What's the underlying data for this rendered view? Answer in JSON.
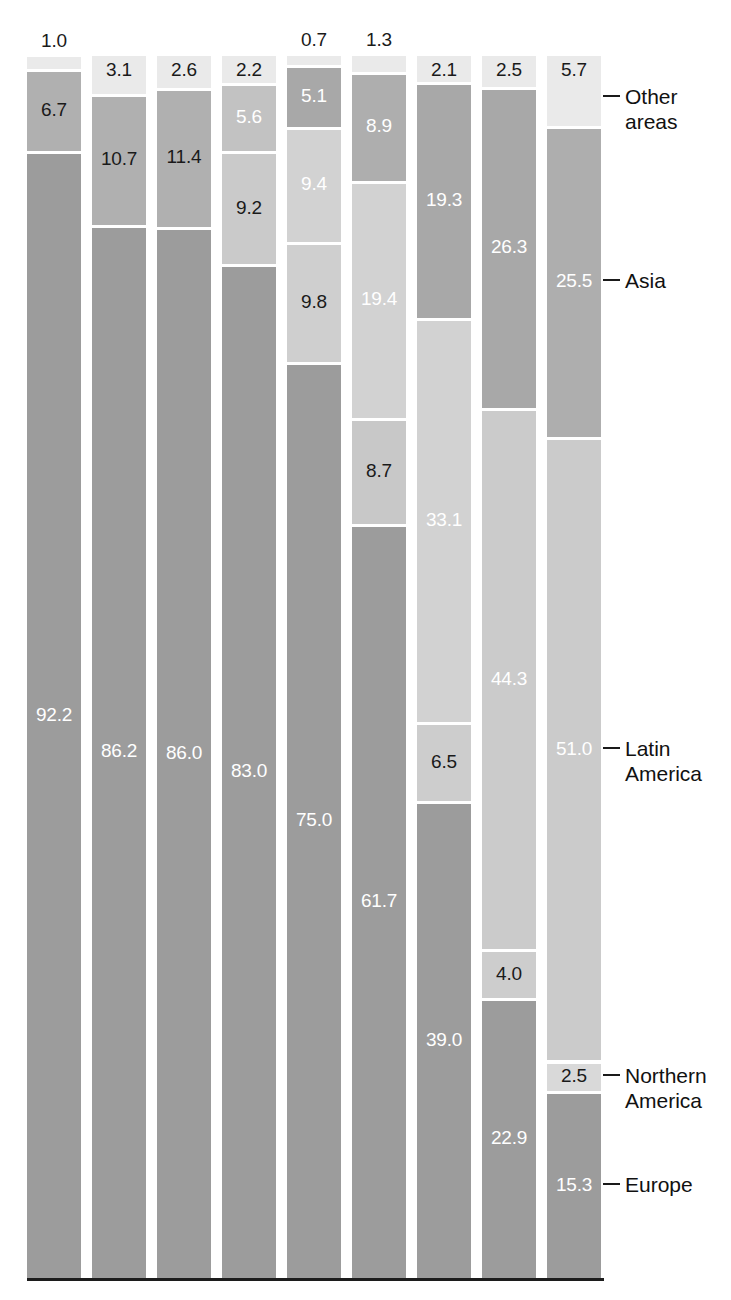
{
  "chart_data": {
    "type": "bar",
    "subtype": "stacked-bar-100-percent",
    "title": "",
    "subtitle": "",
    "xlabel": "",
    "ylabel": "",
    "ylim": [
      0,
      100
    ],
    "grid": false,
    "legend_position": "right-inline-callouts",
    "orientation": "vertical",
    "stack_order_bottom_to_top": [
      "Europe",
      "Northern America",
      "Latin America",
      "Asia",
      "Other areas"
    ],
    "categories": [
      "1",
      "2",
      "3",
      "4",
      "5",
      "6",
      "7",
      "8",
      "9"
    ],
    "series": [
      {
        "name": "Europe",
        "color": "#9c9c9c",
        "values": [
          92.2,
          86.2,
          86.0,
          83.0,
          75.0,
          61.7,
          39.0,
          22.9,
          15.3
        ]
      },
      {
        "name": "Northern America",
        "color": "#d9d9d9",
        "values": [
          null,
          null,
          null,
          null,
          9.8,
          8.7,
          6.5,
          4.0,
          2.5
        ]
      },
      {
        "name": "Latin America",
        "color": "#cacaca",
        "values": [
          null,
          null,
          null,
          9.2,
          9.4,
          19.4,
          33.1,
          44.3,
          51.0
        ]
      },
      {
        "name": "Asia",
        "color": "#b0b0b0",
        "values": [
          6.7,
          10.7,
          11.4,
          5.6,
          5.1,
          8.9,
          19.3,
          26.3,
          25.5
        ]
      },
      {
        "name": "Other areas",
        "color": "#eaeaea",
        "values": [
          1.0,
          3.1,
          2.6,
          2.2,
          0.7,
          1.3,
          2.1,
          2.5,
          5.7
        ]
      }
    ],
    "bars": [
      {
        "index": 1,
        "top_label": "1.0",
        "top_label_outside": true,
        "segments": [
          {
            "name": "Europe",
            "value": 92.2,
            "label": "92.2",
            "label_color": "light",
            "color": "#9c9c9c"
          },
          {
            "name": "Asia",
            "value": 6.7,
            "label": "6.7",
            "label_color": "dark",
            "color": "#b0b0b0"
          },
          {
            "name": "Other areas",
            "value": 1.0,
            "label": "1.0",
            "label_color": "dark",
            "color": "#eaeaea"
          }
        ]
      },
      {
        "index": 2,
        "top_label": "3.1",
        "top_label_outside": false,
        "segments": [
          {
            "name": "Europe",
            "value": 86.2,
            "label": "86.2",
            "label_color": "light",
            "color": "#9c9c9c"
          },
          {
            "name": "Asia",
            "value": 10.7,
            "label": "10.7",
            "label_color": "dark",
            "color": "#b0b0b0"
          },
          {
            "name": "Other areas",
            "value": 3.1,
            "label": "3.1",
            "label_color": "dark",
            "color": "#eaeaea"
          }
        ]
      },
      {
        "index": 3,
        "top_label": "2.6",
        "top_label_outside": false,
        "segments": [
          {
            "name": "Europe",
            "value": 86.0,
            "label": "86.0",
            "label_color": "light",
            "color": "#9c9c9c"
          },
          {
            "name": "Asia",
            "value": 11.4,
            "label": "11.4",
            "label_color": "dark",
            "color": "#b0b0b0"
          },
          {
            "name": "Other areas",
            "value": 2.6,
            "label": "2.6",
            "label_color": "dark",
            "color": "#eaeaea"
          }
        ]
      },
      {
        "index": 4,
        "top_label": "2.2",
        "top_label_outside": false,
        "segments": [
          {
            "name": "Europe",
            "value": 83.0,
            "label": "83.0",
            "label_color": "light",
            "color": "#9c9c9c"
          },
          {
            "name": "Latin America",
            "value": 9.2,
            "label": "9.2",
            "label_color": "dark",
            "color": "#cacaca"
          },
          {
            "name": "Asia",
            "value": 5.6,
            "label": "5.6",
            "label_color": "light",
            "color": "#c2c2c2"
          },
          {
            "name": "Other areas",
            "value": 2.2,
            "label": "2.2",
            "label_color": "dark",
            "color": "#eaeaea"
          }
        ]
      },
      {
        "index": 5,
        "top_label": "0.7",
        "top_label_outside": true,
        "segments": [
          {
            "name": "Europe",
            "value": 75.0,
            "label": "75.0",
            "label_color": "light",
            "color": "#9c9c9c"
          },
          {
            "name": "Northern America",
            "value": 9.8,
            "label": "9.8",
            "label_color": "dark",
            "color": "#cfcfcf"
          },
          {
            "name": "Latin America",
            "value": 9.4,
            "label": "9.4",
            "label_color": "light",
            "color": "#d2d2d2"
          },
          {
            "name": "Asia",
            "value": 5.1,
            "label": "5.1",
            "label_color": "light",
            "color": "#a8a8a8"
          },
          {
            "name": "Other areas",
            "value": 0.7,
            "label": "0.7",
            "label_color": "dark",
            "color": "#eaeaea"
          }
        ]
      },
      {
        "index": 6,
        "top_label": "1.3",
        "top_label_outside": true,
        "segments": [
          {
            "name": "Europe",
            "value": 61.7,
            "label": "61.7",
            "label_color": "light",
            "color": "#9c9c9c"
          },
          {
            "name": "Northern America",
            "value": 8.7,
            "label": "8.7",
            "label_color": "dark",
            "color": "#c8c8c8"
          },
          {
            "name": "Latin America",
            "value": 19.4,
            "label": "19.4",
            "label_color": "light",
            "color": "#d2d2d2"
          },
          {
            "name": "Asia",
            "value": 8.9,
            "label": "8.9",
            "label_color": "light",
            "color": "#aeaeae"
          },
          {
            "name": "Other areas",
            "value": 1.3,
            "label": "1.3",
            "label_color": "dark",
            "color": "#eaeaea"
          }
        ]
      },
      {
        "index": 7,
        "top_label": "2.1",
        "top_label_outside": false,
        "segments": [
          {
            "name": "Europe",
            "value": 39.0,
            "label": "39.0",
            "label_color": "light",
            "color": "#9c9c9c"
          },
          {
            "name": "Northern America",
            "value": 6.5,
            "label": "6.5",
            "label_color": "dark",
            "color": "#cdcdcd"
          },
          {
            "name": "Latin America",
            "value": 33.1,
            "label": "33.1",
            "label_color": "light",
            "color": "#d2d2d2"
          },
          {
            "name": "Asia",
            "value": 19.3,
            "label": "19.3",
            "label_color": "light",
            "color": "#a8a8a8"
          },
          {
            "name": "Other areas",
            "value": 2.1,
            "label": "2.1",
            "label_color": "dark",
            "color": "#eaeaea"
          }
        ]
      },
      {
        "index": 8,
        "top_label": "2.5",
        "top_label_outside": false,
        "segments": [
          {
            "name": "Europe",
            "value": 22.9,
            "label": "22.9",
            "label_color": "light",
            "color": "#9c9c9c"
          },
          {
            "name": "Northern America",
            "value": 4.0,
            "label": "4.0",
            "label_color": "dark",
            "color": "#cdcdcd"
          },
          {
            "name": "Latin America",
            "value": 44.3,
            "label": "44.3",
            "label_color": "light",
            "color": "#cbcbcb"
          },
          {
            "name": "Asia",
            "value": 26.3,
            "label": "26.3",
            "label_color": "light",
            "color": "#a8a8a8"
          },
          {
            "name": "Other areas",
            "value": 2.5,
            "label": "2.5",
            "label_color": "dark",
            "color": "#eaeaea"
          }
        ]
      },
      {
        "index": 9,
        "top_label": "",
        "top_label_outside": false,
        "segments": [
          {
            "name": "Europe",
            "value": 15.3,
            "label": "15.3",
            "label_color": "light",
            "color": "#9c9c9c"
          },
          {
            "name": "Northern America",
            "value": 2.5,
            "label": "2.5",
            "label_color": "dark",
            "color": "#d9d9d9"
          },
          {
            "name": "Latin America",
            "value": 51.0,
            "label": "51.0",
            "label_color": "light",
            "color": "#cbcbcb"
          },
          {
            "name": "Asia",
            "value": 25.5,
            "label": "25.5",
            "label_color": "light",
            "color": "#aeaeae"
          },
          {
            "name": "Other areas",
            "value": 5.7,
            "label": "5.7",
            "label_color": "dark",
            "color": "#eaeaea"
          }
        ]
      }
    ],
    "annotations": [
      {
        "id": "other-areas",
        "text": "Other\nareas",
        "value": 5.7,
        "series": "Other areas"
      },
      {
        "id": "asia",
        "text": "Asia",
        "value": 25.5,
        "series": "Asia"
      },
      {
        "id": "latin",
        "text": "Latin\nAmerica",
        "value": 51.0,
        "series": "Latin America"
      },
      {
        "id": "northern",
        "text": "Northern\nAmerica",
        "value": 2.5,
        "series": "Northern America"
      },
      {
        "id": "europe",
        "text": "Europe",
        "value": 15.3,
        "series": "Europe"
      }
    ],
    "colors": {
      "other_areas": "#eaeaea",
      "asia": "#aeaeae",
      "latin_america": "#cbcbcb",
      "northern_america": "#d9d9d9",
      "europe": "#9c9c9c",
      "axis": "#1c1c1c",
      "text_dark": "#111111",
      "text_light": "#ffffff"
    }
  }
}
